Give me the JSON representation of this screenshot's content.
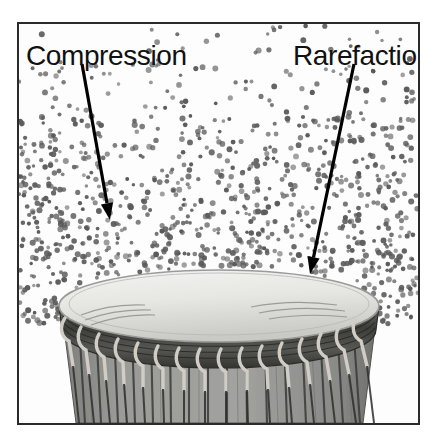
{
  "figure": {
    "border_color": "#2b2b2b",
    "background_color": "#ffffff",
    "panel_background": "#fdfdfd"
  },
  "labels": {
    "compression": "Compression",
    "rarefaction": "Rarefaction",
    "text_color": "#111111",
    "font_size_px": 28
  },
  "annotations": [
    {
      "name": "compression-arrow",
      "label": "Compression",
      "from": [
        63,
        40
      ],
      "to": [
        91,
        196
      ],
      "color": "#000000",
      "stroke_width": 3.2
    },
    {
      "name": "rarefaction-arrow",
      "label": "Rarefaction",
      "from": [
        335,
        40
      ],
      "to": [
        291,
        250
      ],
      "color": "#000000",
      "stroke_width": 3.2
    }
  ],
  "particles": {
    "description": "Air molecules shown as dots; density increases toward the drum head",
    "dot_color": "#5a5a5a",
    "dot_radius_px": 2.4,
    "count": 980,
    "density_regions": [
      {
        "name": "sparse-top",
        "y_range": [
          0,
          90
        ],
        "relative_density": 0.25
      },
      {
        "name": "medium-middle",
        "y_range": [
          90,
          170
        ],
        "relative_density": 0.6
      },
      {
        "name": "dense-compression",
        "y_range": [
          170,
          270
        ],
        "relative_density": 1.0
      }
    ]
  },
  "drum": {
    "name": "djembe-drum",
    "head_color": "#e9e9e7",
    "head_edge_color": "#9a9a98",
    "rim_color": "#4a4a48",
    "rope_color": "#d8d6cf",
    "body_color": "#8e8e8c",
    "body_stripe_color": "#3a3a38",
    "head_center": [
      200,
      282
    ],
    "head_radius_x": 160,
    "head_radius_y": 36,
    "rope_loop_count": 19,
    "body_stripe_count": 17
  },
  "colors": {
    "ink": "#111111",
    "dot": "#5a5a5a",
    "frame": "#2b2b2b"
  }
}
